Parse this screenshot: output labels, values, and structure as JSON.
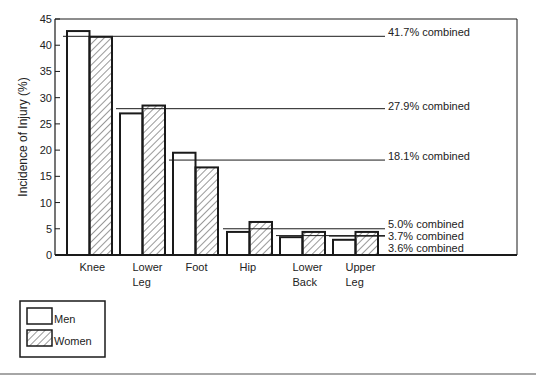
{
  "chart_data": {
    "type": "bar",
    "title": "",
    "xlabel": "",
    "ylabel": "Incidence of Injury (%)",
    "ylim": [
      0,
      45
    ],
    "yticks": [
      0,
      5,
      10,
      15,
      20,
      25,
      30,
      35,
      40,
      45
    ],
    "grid": false,
    "legend_position": "bottom-left, outside plot",
    "categories": [
      "Knee",
      "Lower Leg",
      "Foot",
      "Hip",
      "Lower Back",
      "Upper Leg"
    ],
    "category_labels": [
      [
        "Knee"
      ],
      [
        "Lower",
        "Leg"
      ],
      [
        "Foot"
      ],
      [
        "Hip"
      ],
      [
        "Lower",
        "Back"
      ],
      [
        "Upper",
        "Leg"
      ]
    ],
    "series": [
      {
        "name": "Men",
        "pattern": "open",
        "values": [
          42.7,
          27.0,
          19.5,
          4.4,
          3.4,
          2.9
        ]
      },
      {
        "name": "Women",
        "pattern": "hatched",
        "values": [
          41.6,
          28.5,
          16.7,
          6.3,
          4.4,
          4.4
        ]
      }
    ],
    "combined": [
      {
        "category": "Knee",
        "value": 41.7,
        "label": "41.7% combined"
      },
      {
        "category": "Lower Leg",
        "value": 27.9,
        "label": "27.9% combined"
      },
      {
        "category": "Foot",
        "value": 18.1,
        "label": "18.1% combined"
      },
      {
        "category": "Hip",
        "value": 5.0,
        "label": "5.0% combined"
      },
      {
        "category": "Lower Back",
        "value": 3.7,
        "label": "3.7% combined"
      },
      {
        "category": "Upper Leg",
        "value": 3.6,
        "label": "3.6% combined"
      }
    ]
  },
  "legend": {
    "items": [
      {
        "label": "Men",
        "pattern": "open"
      },
      {
        "label": "Women",
        "pattern": "hatched"
      }
    ]
  },
  "colors": {
    "ink": "#1a1a1a",
    "background": "#ffffff",
    "rule": "#888888"
  }
}
